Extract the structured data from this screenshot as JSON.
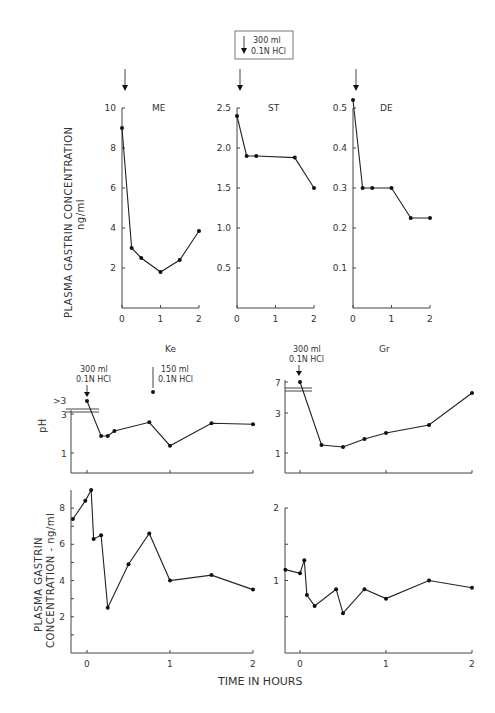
{
  "chart_data": [
    {
      "type": "line",
      "panel": "top-1",
      "title": "ME",
      "xlabel": "",
      "ylabel": "PLASMA GASTRIN CONCENTRATION ng/ml",
      "xlim": [
        0,
        2
      ],
      "ylim": [
        0,
        10
      ],
      "xticks": [
        0,
        1,
        2
      ],
      "yticks": [
        2,
        4,
        6,
        8,
        10
      ],
      "x": [
        0,
        0.25,
        0.5,
        1.0,
        1.5,
        2.0
      ],
      "values": [
        9.0,
        3.0,
        2.5,
        1.8,
        2.4,
        3.85
      ],
      "annotations": [
        {
          "x": 0,
          "label": "arrow (300 ml 0.1N HCl)"
        }
      ]
    },
    {
      "type": "line",
      "panel": "top-2",
      "title": "ST",
      "xlim": [
        0,
        2
      ],
      "ylim": [
        0,
        2.5
      ],
      "xticks": [
        0,
        1,
        2
      ],
      "yticks": [
        0.5,
        1.0,
        1.5,
        2.0,
        2.5
      ],
      "x": [
        0,
        0.25,
        0.5,
        1.5,
        2.0
      ],
      "values": [
        2.4,
        1.9,
        1.9,
        1.88,
        1.5
      ],
      "annotations": [
        {
          "x": 0,
          "label": "arrow (300 ml 0.1N HCl)"
        }
      ]
    },
    {
      "type": "line",
      "panel": "top-3",
      "title": "DE",
      "xlim": [
        0,
        2
      ],
      "ylim": [
        0,
        0.5
      ],
      "xticks": [
        0,
        1,
        2
      ],
      "yticks": [
        0.1,
        0.2,
        0.3,
        0.4,
        0.5
      ],
      "x": [
        0,
        0.25,
        0.5,
        1.0,
        1.5,
        2.0
      ],
      "values": [
        0.52,
        0.3,
        0.3,
        0.3,
        0.225,
        0.225
      ],
      "annotations": [
        {
          "x": 0,
          "label": "arrow (300 ml 0.1N HCl)"
        }
      ]
    },
    {
      "type": "line",
      "panel": "ke-ph",
      "title": "Ke",
      "ylabel": "pH",
      "xlim": [
        -0.2,
        2
      ],
      "ylim": [
        0,
        3.5
      ],
      "yticks": [
        1,
        3
      ],
      "ytick_break": ">3",
      "x": [
        0,
        0.17,
        0.25,
        0.33,
        0.75,
        1.0,
        1.5,
        2.0
      ],
      "values": [
        ">3",
        1.9,
        1.9,
        2.15,
        2.6,
        1.4,
        2.55,
        2.5
      ],
      "annotations": [
        {
          "x": 0,
          "label": "300 ml 0.1N HCl"
        },
        {
          "x": 0.75,
          "label": "150 ml 0.1N HCl"
        }
      ]
    },
    {
      "type": "line",
      "panel": "gr-ph",
      "title": "Gr",
      "xlim": [
        -0.2,
        2
      ],
      "ylim": [
        0,
        7
      ],
      "yticks": [
        1,
        3,
        7
      ],
      "x": [
        0,
        0.25,
        0.5,
        0.75,
        1.0,
        1.5,
        2.0
      ],
      "values": [
        7,
        1.4,
        1.3,
        1.7,
        2.0,
        2.4,
        4.0
      ],
      "annotations": [
        {
          "x": 0,
          "label": "300 ml 0.1N HCl"
        }
      ]
    },
    {
      "type": "line",
      "panel": "ke-gastrin",
      "ylabel": "PLASMA GASTRIN CONCENTRATION - ng/ml",
      "xlim": [
        -0.2,
        2
      ],
      "ylim": [
        0,
        9
      ],
      "xticks": [
        0,
        1,
        2
      ],
      "yticks": [
        2,
        4,
        6,
        8
      ],
      "x": [
        -0.17,
        -0.02,
        0.05,
        0.08,
        0.17,
        0.25,
        0.5,
        0.75,
        1.0,
        1.5,
        2.0
      ],
      "values": [
        7.4,
        8.4,
        9.0,
        6.3,
        6.5,
        2.5,
        4.9,
        6.6,
        4.0,
        4.3,
        3.5
      ]
    },
    {
      "type": "line",
      "panel": "gr-gastrin",
      "xlim": [
        -0.2,
        2
      ],
      "ylim": [
        0,
        2
      ],
      "xticks": [
        0,
        1,
        2
      ],
      "yticks": [
        1,
        2
      ],
      "x": [
        -0.17,
        0.0,
        0.05,
        0.08,
        0.17,
        0.42,
        0.5,
        0.75,
        1.0,
        1.5,
        2.0
      ],
      "values": [
        1.15,
        1.1,
        1.28,
        0.8,
        0.65,
        0.88,
        0.55,
        0.88,
        0.75,
        1.0,
        0.9
      ]
    }
  ],
  "figure": {
    "legend_box": {
      "line1": "300 ml",
      "line2": "0.1N HCl"
    },
    "top_ylabel_line1": "PLASMA  GASTRIN  CONCENTRATION",
    "top_ylabel_line2": "ng/ml",
    "ph_label": "pH",
    "bottom_ylabel_line1": "PLASMA  GASTRIN",
    "bottom_ylabel_line2": "CONCENTRATION - ng/ml",
    "xlabel": "TIME  IN  HOURS",
    "ke_note1_a": "300 ml",
    "ke_note1_b": "0.1N HCl",
    "ke_note2_a": "150 ml",
    "ke_note2_b": "0.1N HCl",
    "gr_note_a": "300 ml",
    "gr_note_b": "0.1N HCl",
    "ke_break_label": ">3",
    "titles": {
      "me": "ME",
      "st": "ST",
      "de": "DE",
      "ke": "Ke",
      "gr": "Gr"
    }
  }
}
